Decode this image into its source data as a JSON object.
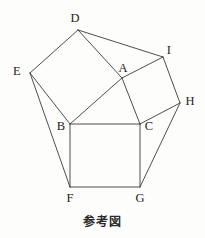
{
  "figure": {
    "caption": "参考図",
    "stroke_color": "#3a3a3a",
    "background_color": "#fdfdfc",
    "label_color": "#232323",
    "stroke_width": 0.9
  },
  "vertices": [
    {
      "id": "D",
      "label": "D",
      "x": 78,
      "y": 30,
      "label_x": 75,
      "label_y": 18
    },
    {
      "id": "E",
      "label": "E",
      "x": 30,
      "y": 73,
      "label_x": 17,
      "label_y": 71
    },
    {
      "id": "A",
      "label": "A",
      "x": 122,
      "y": 78,
      "label_x": 123,
      "label_y": 68
    },
    {
      "id": "I",
      "label": "I",
      "x": 163,
      "y": 57,
      "label_x": 169,
      "label_y": 50
    },
    {
      "id": "H",
      "label": "H",
      "x": 180,
      "y": 103,
      "label_x": 190,
      "label_y": 101
    },
    {
      "id": "B",
      "label": "B",
      "x": 70,
      "y": 124,
      "label_x": 61,
      "label_y": 126
    },
    {
      "id": "C",
      "label": "C",
      "x": 140,
      "y": 124,
      "label_x": 149,
      "label_y": 126
    },
    {
      "id": "F",
      "label": "F",
      "x": 70,
      "y": 187,
      "label_x": 70,
      "label_y": 198
    },
    {
      "id": "G",
      "label": "G",
      "x": 140,
      "y": 187,
      "label_x": 140,
      "label_y": 198
    }
  ],
  "edges": [
    {
      "name": "square-bcgf-top",
      "from": "B",
      "to": "C"
    },
    {
      "name": "square-bcgf-right",
      "from": "C",
      "to": "G"
    },
    {
      "name": "square-bcgf-bottom",
      "from": "G",
      "to": "F"
    },
    {
      "name": "square-bcgf-left",
      "from": "F",
      "to": "B"
    },
    {
      "name": "square-edab-ed",
      "from": "E",
      "to": "D"
    },
    {
      "name": "square-edab-da",
      "from": "D",
      "to": "A"
    },
    {
      "name": "square-edab-ab",
      "from": "A",
      "to": "B"
    },
    {
      "name": "square-edab-be",
      "from": "B",
      "to": "E"
    },
    {
      "name": "square-aihc-ai",
      "from": "A",
      "to": "I"
    },
    {
      "name": "square-aihc-ih",
      "from": "I",
      "to": "H"
    },
    {
      "name": "square-aihc-hc",
      "from": "H",
      "to": "C"
    },
    {
      "name": "square-aihc-ca",
      "from": "C",
      "to": "A"
    },
    {
      "name": "connector-di",
      "from": "D",
      "to": "I"
    },
    {
      "name": "connector-ef",
      "from": "E",
      "to": "F"
    },
    {
      "name": "connector-hg",
      "from": "H",
      "to": "G"
    }
  ],
  "chart_data": {
    "type": "diagram",
    "title": "参考図",
    "shapes": [
      {
        "name": "central-square",
        "vertices": [
          "B",
          "C",
          "G",
          "F"
        ]
      },
      {
        "name": "square-on-AB",
        "vertices": [
          "E",
          "D",
          "A",
          "B"
        ]
      },
      {
        "name": "square-on-AC",
        "vertices": [
          "A",
          "I",
          "H",
          "C"
        ]
      },
      {
        "name": "triangle-ABC",
        "vertices": [
          "A",
          "B",
          "C"
        ]
      }
    ],
    "connectors": [
      [
        "D",
        "I"
      ],
      [
        "E",
        "F"
      ],
      [
        "H",
        "G"
      ]
    ]
  }
}
